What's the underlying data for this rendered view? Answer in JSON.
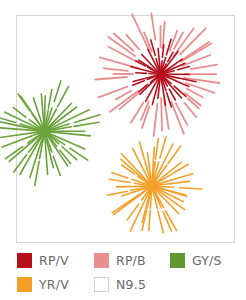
{
  "figure": {
    "bursts": [
      {
        "name": "rp-b-burst",
        "color_key": "RP/B",
        "color": "#ea8f8f",
        "center": [
          0.66,
          0.26
        ],
        "radius_inner": 0.1,
        "radius_outer": 0.32,
        "rays": 40
      },
      {
        "name": "rp-v-burst",
        "color_key": "RP/V",
        "color": "#b5101c",
        "center": [
          0.66,
          0.26
        ],
        "radius_inner": 0.0,
        "radius_outer": 0.17,
        "rays": 30
      },
      {
        "name": "gy-s-burst",
        "color_key": "GY/S",
        "color": "#6aa33a",
        "center": [
          0.13,
          0.51
        ],
        "radius_inner": 0.0,
        "radius_outer": 0.27,
        "rays": 36
      },
      {
        "name": "yr-v-burst",
        "color_key": "YR/V",
        "color": "#f4a028",
        "center": [
          0.62,
          0.75
        ],
        "radius_inner": 0.0,
        "radius_outer": 0.25,
        "rays": 36
      }
    ]
  },
  "legend": {
    "rows": [
      [
        {
          "label": "RP∕V",
          "color": "#b5101c"
        },
        {
          "label": "RP∕B",
          "color": "#ea8f8f"
        },
        {
          "label": "GY∕S",
          "color": "#5e9a2e"
        }
      ],
      [
        {
          "label": "YR∕V",
          "color": "#f4a028"
        },
        {
          "label": "N9.5",
          "color": "#ffffff"
        }
      ]
    ]
  }
}
